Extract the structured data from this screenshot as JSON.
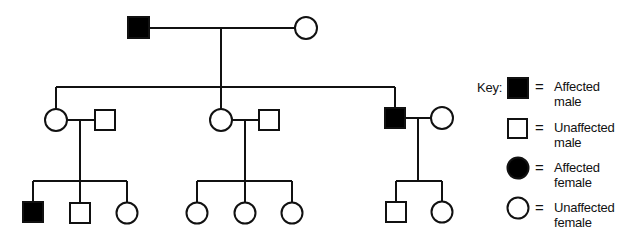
{
  "diagram": {
    "type": "pedigree",
    "colors": {
      "line": "#111111",
      "affected_fill": "#000000",
      "unaffected_fill": "#ffffff"
    },
    "generations": [
      {
        "label": "I",
        "individuals": [
          {
            "id": "I-1",
            "sex": "male",
            "affected": true
          },
          {
            "id": "I-2",
            "sex": "female",
            "affected": false
          }
        ]
      },
      {
        "label": "II",
        "families": [
          {
            "child": {
              "id": "II-1",
              "sex": "female",
              "affected": false
            },
            "spouse": {
              "id": "II-2",
              "sex": "male",
              "affected": false
            }
          },
          {
            "child": {
              "id": "II-3",
              "sex": "female",
              "affected": false
            },
            "spouse": {
              "id": "II-4",
              "sex": "male",
              "affected": false
            }
          },
          {
            "child": {
              "id": "II-5",
              "sex": "male",
              "affected": true
            },
            "spouse": {
              "id": "II-6",
              "sex": "female",
              "affected": false
            }
          }
        ]
      },
      {
        "label": "III",
        "sibships": [
          {
            "parents": [
              "II-1",
              "II-2"
            ],
            "children": [
              {
                "id": "III-1",
                "sex": "male",
                "affected": true
              },
              {
                "id": "III-2",
                "sex": "male",
                "affected": false
              },
              {
                "id": "III-3",
                "sex": "female",
                "affected": false
              }
            ]
          },
          {
            "parents": [
              "II-3",
              "II-4"
            ],
            "children": [
              {
                "id": "III-4",
                "sex": "female",
                "affected": false
              },
              {
                "id": "III-5",
                "sex": "female",
                "affected": false
              },
              {
                "id": "III-6",
                "sex": "female",
                "affected": false
              }
            ]
          },
          {
            "parents": [
              "II-5",
              "II-6"
            ],
            "children": [
              {
                "id": "III-7",
                "sex": "male",
                "affected": false
              },
              {
                "id": "III-8",
                "sex": "female",
                "affected": false
              }
            ]
          }
        ]
      }
    ]
  },
  "key": {
    "title": "Key:",
    "equals": "=",
    "items": [
      {
        "symbol": "filled-square",
        "line1": "Affected",
        "line2": "male"
      },
      {
        "symbol": "open-square",
        "line1": "Unaffected",
        "line2": "male"
      },
      {
        "symbol": "filled-circle",
        "line1": "Affected",
        "line2": "female"
      },
      {
        "symbol": "open-circle",
        "line1": "Unaffected",
        "line2": "female"
      }
    ]
  }
}
